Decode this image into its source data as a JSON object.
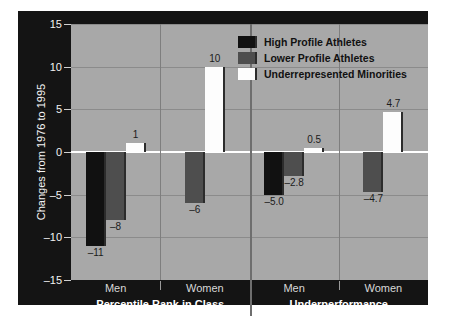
{
  "chart_data": {
    "type": "bar",
    "title": "",
    "xlabel": "",
    "ylabel": "Changes from 1976 to 1995",
    "ylim": [
      -15,
      15
    ],
    "yticks": [
      15,
      10,
      5,
      0,
      -5,
      -10,
      -15
    ],
    "ytick_labels": [
      "15",
      "10",
      "5",
      "0",
      "–5",
      "–10",
      "–15"
    ],
    "grid": true,
    "legend_position": "top-center",
    "panels": [
      {
        "name": "Percentile Rank in Class",
        "groups": [
          {
            "name": "Men",
            "bars": [
              {
                "series": "High Profile Athletes",
                "value": -11,
                "label": "–11"
              },
              {
                "series": "Lower Profile Athletes",
                "value": -8,
                "label": "–8"
              },
              {
                "series": "Underrepresented Minorities",
                "value": 1,
                "label": "1"
              }
            ]
          },
          {
            "name": "Women",
            "bars": [
              {
                "series": "Lower Profile Athletes",
                "value": -6,
                "label": "–6"
              },
              {
                "series": "Underrepresented Minorities",
                "value": 10,
                "label": "10"
              }
            ]
          }
        ]
      },
      {
        "name": "Underperformance",
        "groups": [
          {
            "name": "Men",
            "bars": [
              {
                "series": "High Profile Athletes",
                "value": -5.0,
                "label": "–5.0"
              },
              {
                "series": "Lower Profile Athletes",
                "value": -2.8,
                "label": "–2.8"
              },
              {
                "series": "Underrepresented Minorities",
                "value": 0.5,
                "label": "0.5"
              }
            ]
          },
          {
            "name": "Women",
            "bars": [
              {
                "series": "Lower Profile Athletes",
                "value": -4.7,
                "label": "–4.7"
              },
              {
                "series": "Underrepresented Minorities",
                "value": 4.7,
                "label": "4.7"
              }
            ]
          }
        ]
      }
    ],
    "series": [
      {
        "name": "High Profile Athletes",
        "key": "high",
        "color": "#111111"
      },
      {
        "name": "Lower Profile Athletes",
        "key": "lower",
        "color": "#4e4e4e"
      },
      {
        "name": "Underrepresented Minorities",
        "key": "under",
        "color": "#fdfdfd"
      }
    ]
  },
  "legend": {
    "items": [
      {
        "label": "High Profile Athletes",
        "key": "high"
      },
      {
        "label": "Lower Profile Athletes",
        "key": "lower"
      },
      {
        "label": "Underrepresented Minorities",
        "key": "under"
      }
    ]
  },
  "axes": {
    "y_title": "Changes from 1976 to 1995",
    "y_tick_labels": [
      "15",
      "10",
      "5",
      "0",
      "–5",
      "–10",
      "–15"
    ]
  },
  "colors": {
    "panel_background": "#141414",
    "plot_background": "#a8a8a8",
    "gridline": "#8b8b8b",
    "zeroline": "#ffffff",
    "high_profile": "#111111",
    "lower_profile": "#4e4e4e",
    "underrepresented": "#fdfdfd",
    "axis_text": "#f2f2f2",
    "bar_label_text": "#1b1b1b"
  }
}
